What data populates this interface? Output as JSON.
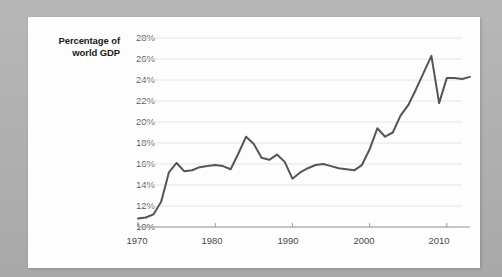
{
  "figure": {
    "background_color": "#b3b3b3",
    "card_color": "#fdfdfd"
  },
  "chart_data": {
    "type": "line",
    "title": "",
    "subtitle": "",
    "xlabel": "",
    "ylabel": "Percentage of world GDP",
    "ylabel_line1": "Percentage of",
    "ylabel_line2": "world GDP",
    "grid": true,
    "grid_axis": "y",
    "legend": false,
    "legend_position": "none",
    "line_color": "#555555",
    "line_width": 2,
    "grid_color": "#e6e6e6",
    "axis_color": "#9a9a9a",
    "xlim": [
      1970,
      2013
    ],
    "ylim": [
      10,
      28
    ],
    "yticks": [
      10,
      12,
      14,
      16,
      18,
      20,
      22,
      24,
      26,
      28
    ],
    "ytick_labels": [
      "10%",
      "12%",
      "14%",
      "16%",
      "18%",
      "20%",
      "22%",
      "24%",
      "26%",
      "28%"
    ],
    "xticks": [
      1970,
      1980,
      1990,
      2000,
      2010
    ],
    "xtick_labels": [
      "1970",
      "1980",
      "1990",
      "2000",
      "2010"
    ],
    "series": [
      {
        "name": "World trade as percentage of world GDP",
        "color": "#555555",
        "x": [
          1970,
          1971,
          1972,
          1973,
          1974,
          1975,
          1976,
          1977,
          1978,
          1979,
          1980,
          1981,
          1982,
          1983,
          1984,
          1985,
          1986,
          1987,
          1988,
          1989,
          1990,
          1991,
          1992,
          1993,
          1994,
          1995,
          1996,
          1997,
          1998,
          1999,
          2000,
          2001,
          2002,
          2003,
          2004,
          2005,
          2006,
          2007,
          2008,
          2009,
          2010,
          2011,
          2012,
          2013
        ],
        "values": [
          10.8,
          10.9,
          11.2,
          12.4,
          15.2,
          16.1,
          15.3,
          15.4,
          15.7,
          15.8,
          15.9,
          15.8,
          15.5,
          17.0,
          18.6,
          17.9,
          16.6,
          16.4,
          16.9,
          16.2,
          14.6,
          15.2,
          15.6,
          15.9,
          16.0,
          15.8,
          15.6,
          15.5,
          15.4,
          15.9,
          17.4,
          19.4,
          18.6,
          19.0,
          20.6,
          21.6,
          23.1,
          24.7,
          26.3,
          21.8,
          24.2,
          24.2,
          24.1,
          24.3
        ]
      }
    ]
  }
}
